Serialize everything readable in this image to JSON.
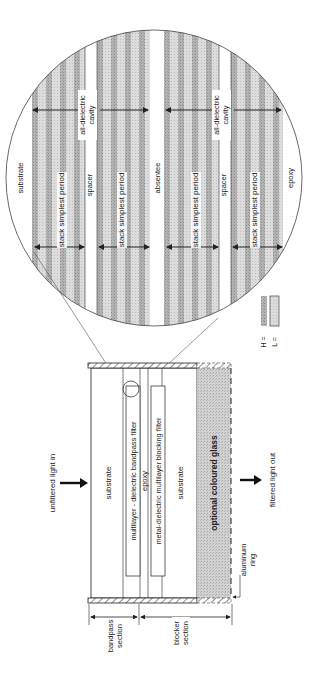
{
  "colors": {
    "ink": "#222222",
    "h_layer": "#a9a9a9",
    "l_layer": "#d6d6d6",
    "glass": "#c8c8c8",
    "background": "#ffffff"
  },
  "housing": {
    "substrate_top": "substrate",
    "bandpass_filter": "multilayer - dielectric bandpass filter",
    "epoxy": "epoxy",
    "blocking_filter": "metal-dielectric multilayer blocking filter",
    "substrate_bottom": "substrate",
    "coloured_glass": "optional coloured glass"
  },
  "annotations": {
    "light_in": "unfiltered light in",
    "light_out": "filtered light out",
    "bandpass_section": [
      "bandpass",
      "section"
    ],
    "blocker_section": [
      "blocker",
      "section"
    ],
    "aluminum_ring": [
      "aluminum",
      "ring"
    ]
  },
  "magnified": {
    "substrate": "substrate",
    "epoxy": "epoxy",
    "absentee": "absentee",
    "spacer_1": "spacer",
    "spacer_2": "spacer",
    "cavity_1": [
      "all-dielectric",
      "cavity"
    ],
    "cavity_2": [
      "all-dielectric",
      "cavity"
    ],
    "stack_1": "stack simplest period",
    "stack_2": "stack simplest period",
    "stack_3": "stack simplest period",
    "stack_4": "stack simplest period"
  },
  "legend": {
    "h_label": "H =",
    "l_label": "L ="
  }
}
